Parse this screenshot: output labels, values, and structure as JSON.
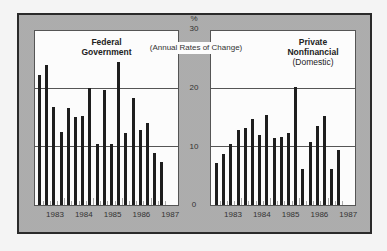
{
  "chart_data": [
    {
      "type": "bar",
      "title": "Federal Government",
      "subtitle": "(Annual Rates of Change)",
      "ylabel": "%",
      "ylim": [
        0,
        30
      ],
      "yticks": [
        0,
        10,
        20,
        30
      ],
      "xtick_labels": [
        "1983",
        "1984",
        "1985",
        "1986",
        "1987"
      ],
      "grid": "horizontal at 10 and 20",
      "categories": [
        "1983Q1",
        "1983Q2",
        "1983Q3",
        "1983Q4",
        "1984Q1",
        "1984Q2",
        "1984Q3",
        "1984Q4",
        "1985Q1",
        "1985Q2",
        "1985Q3",
        "1985Q4",
        "1986Q1",
        "1986Q2",
        "1986Q3",
        "1986Q4",
        "1987Q1",
        "1987Q2"
      ],
      "values": [
        22.4,
        24.1,
        16.9,
        12.6,
        16.8,
        15.2,
        15.4,
        20.2,
        10.6,
        19.9,
        10.5,
        24.6,
        12.4,
        18.4,
        12.9,
        14.1,
        9.0,
        7.5
      ]
    },
    {
      "type": "bar",
      "title": "Private Nonfinancial",
      "title_note": "(Domestic)",
      "ylabel": "%",
      "ylim": [
        0,
        30
      ],
      "yticks": [
        0,
        10,
        20,
        30
      ],
      "xtick_labels": [
        "1983",
        "1984",
        "1985",
        "1986",
        "1987"
      ],
      "grid": "horizontal at 10 and 20",
      "categories": [
        "1983Q1",
        "1983Q2",
        "1983Q3",
        "1983Q4",
        "1984Q1",
        "1984Q2",
        "1984Q3",
        "1984Q4",
        "1985Q1",
        "1985Q2",
        "1985Q3",
        "1985Q4",
        "1986Q1",
        "1986Q2",
        "1986Q3",
        "1986Q4",
        "1987Q1",
        "1987Q2"
      ],
      "values": [
        7.2,
        8.8,
        10.5,
        12.9,
        13.2,
        14.8,
        12.1,
        15.5,
        11.5,
        11.7,
        12.5,
        20.4,
        6.2,
        10.9,
        13.6,
        15.3,
        6.2,
        9.5
      ]
    }
  ],
  "labels": {
    "unit": "%",
    "subtitle": "(Annual Rates of Change)",
    "left_title_1": "Federal",
    "left_title_2": "Government",
    "right_title_1": "Private",
    "right_title_2": "Nonfinancial",
    "right_title_3": "(Domestic)",
    "y30": "30",
    "y20": "20",
    "y10": "10",
    "y0": "0"
  }
}
